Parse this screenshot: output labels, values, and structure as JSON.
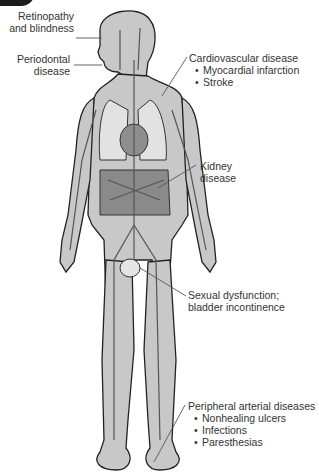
{
  "diagram": {
    "colors": {
      "skin": "#c8c8c8",
      "outline": "#222222",
      "organ": "#8e8e8e",
      "vessel": "#555555",
      "text": "#333333"
    }
  },
  "labels": {
    "retinopathy": {
      "line1": "Retinopathy",
      "line2": "and blindness"
    },
    "periodontal": {
      "line1": "Periodontal",
      "line2": "disease"
    },
    "cardiovascular": {
      "title": "Cardiovascular disease",
      "items": [
        "Myocardial infarction",
        "Stroke"
      ]
    },
    "kidney": {
      "line1": "Kidney",
      "line2": "disease"
    },
    "sexual": {
      "line1": "Sexual dysfunction;",
      "line2": "bladder incontinence"
    },
    "peripheral": {
      "title": "Peripheral arterial diseases",
      "items": [
        "Nonhealing ulcers",
        "Infections",
        "Paresthesias"
      ]
    }
  }
}
